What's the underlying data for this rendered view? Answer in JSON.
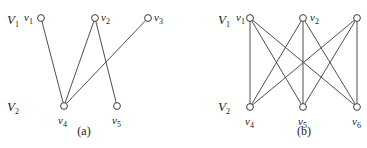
{
  "figures": [
    {
      "id": "a",
      "caption": "(a)",
      "set_labels": [
        {
          "name": "V",
          "sub": "1",
          "x": 7,
          "y": 24
        },
        {
          "name": "V",
          "sub": "2",
          "x": 7,
          "y": 111
        }
      ],
      "nodes": [
        {
          "id": "v1",
          "name": "v",
          "sub": "1",
          "x": 41,
          "y": 18,
          "label_x": 24,
          "label_y": 21
        },
        {
          "id": "v2",
          "name": "v",
          "sub": "2",
          "x": 95,
          "y": 18,
          "label_x": 101,
          "label_y": 21
        },
        {
          "id": "v3",
          "name": "v",
          "sub": "3",
          "x": 148,
          "y": 18,
          "label_x": 154,
          "label_y": 21
        },
        {
          "id": "v4",
          "name": "v",
          "sub": "4",
          "x": 64,
          "y": 106,
          "label_x": 58,
          "label_y": 124
        },
        {
          "id": "v5",
          "name": "v",
          "sub": "5",
          "x": 117,
          "y": 106,
          "label_x": 112,
          "label_y": 124
        }
      ],
      "edges": [
        [
          "v1",
          "v4"
        ],
        [
          "v2",
          "v4"
        ],
        [
          "v2",
          "v5"
        ],
        [
          "v3",
          "v4"
        ]
      ],
      "caption_x": 84,
      "caption_y": 135
    },
    {
      "id": "b",
      "caption": "(b)",
      "set_labels": [
        {
          "name": "V",
          "sub": "1",
          "x": 218,
          "y": 24
        },
        {
          "name": "V",
          "sub": "2",
          "x": 218,
          "y": 111
        }
      ],
      "nodes": [
        {
          "id": "v1",
          "name": "v",
          "sub": "1",
          "x": 250,
          "y": 18,
          "label_x": 236,
          "label_y": 21
        },
        {
          "id": "v2",
          "name": "v",
          "sub": "2",
          "x": 303,
          "y": 18,
          "label_x": 310,
          "label_y": 21
        },
        {
          "id": "v3",
          "name": "",
          "sub": "",
          "x": 357,
          "y": 18,
          "label_x": 0,
          "label_y": 0
        },
        {
          "id": "v4",
          "name": "v",
          "sub": "4",
          "x": 250,
          "y": 107,
          "label_x": 245,
          "label_y": 125
        },
        {
          "id": "v5",
          "name": "v",
          "sub": "5",
          "x": 303,
          "y": 107,
          "label_x": 298,
          "label_y": 125
        },
        {
          "id": "v6",
          "name": "v",
          "sub": "6",
          "x": 357,
          "y": 107,
          "label_x": 352,
          "label_y": 125
        }
      ],
      "edges": [
        [
          "v1",
          "v4"
        ],
        [
          "v1",
          "v5"
        ],
        [
          "v1",
          "v6"
        ],
        [
          "v2",
          "v4"
        ],
        [
          "v2",
          "v5"
        ],
        [
          "v2",
          "v6"
        ],
        [
          "v3",
          "v4"
        ],
        [
          "v3",
          "v5"
        ],
        [
          "v3",
          "v6"
        ]
      ],
      "caption_x": 304,
      "caption_y": 135
    }
  ]
}
